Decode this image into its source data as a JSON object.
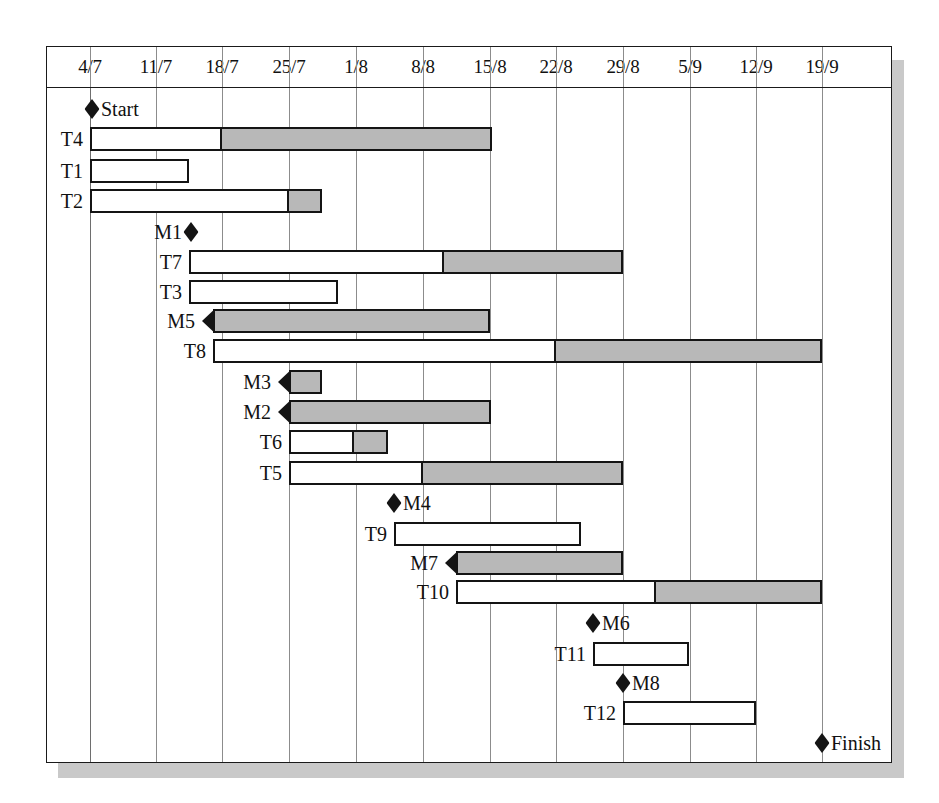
{
  "chart_data": {
    "type": "gantt",
    "title": "",
    "xlabel": "",
    "ylabel": "",
    "grid": true,
    "axis": {
      "tick_labels": [
        "4/7",
        "11/7",
        "18/7",
        "25/7",
        "1/8",
        "8/8",
        "15/8",
        "22/8",
        "29/8",
        "5/9",
        "12/9",
        "19/9"
      ],
      "tick_x": [
        89,
        155,
        221,
        288,
        355,
        422,
        489,
        555,
        622,
        689,
        755,
        821
      ],
      "week_px": 66.5,
      "x_start_px": 89,
      "x_end_px": 890
    },
    "rows": [
      {
        "name": "Start",
        "kind": "milestone",
        "label": "Start",
        "label_side": "right",
        "x": 91,
        "y": 108
      },
      {
        "name": "T4",
        "kind": "task",
        "label": "T4",
        "label_side": "left",
        "y": 138,
        "start": 89,
        "split": 221,
        "end": 491
      },
      {
        "name": "T1",
        "kind": "task",
        "label": "T1",
        "label_side": "left",
        "y": 170,
        "start": 89,
        "split": 188,
        "end": 188
      },
      {
        "name": "T2",
        "kind": "task",
        "label": "T2",
        "label_side": "left",
        "y": 200,
        "start": 89,
        "split": 288,
        "end": 321
      },
      {
        "name": "M1",
        "kind": "milestone",
        "label": "M1",
        "label_side": "left",
        "x": 190,
        "y": 231
      },
      {
        "name": "T7",
        "kind": "task",
        "label": "T7",
        "label_side": "left",
        "y": 261,
        "start": 188,
        "split": 443,
        "end": 622
      },
      {
        "name": "T3",
        "kind": "task",
        "label": "T3",
        "label_side": "left",
        "y": 291,
        "start": 188,
        "split": 337,
        "end": 337
      },
      {
        "name": "M5",
        "kind": "summary",
        "label": "M5",
        "label_side": "left",
        "y": 320,
        "start": 212,
        "end": 489
      },
      {
        "name": "T8",
        "kind": "task",
        "label": "T8",
        "label_side": "left",
        "y": 350,
        "start": 212,
        "split": 555,
        "end": 821
      },
      {
        "name": "M3",
        "kind": "summary",
        "label": "M3",
        "label_side": "left",
        "y": 381,
        "start": 288,
        "end": 321
      },
      {
        "name": "M2",
        "kind": "summary",
        "label": "M2",
        "label_side": "left",
        "y": 411,
        "start": 288,
        "end": 490
      },
      {
        "name": "T6",
        "kind": "task",
        "label": "T6",
        "label_side": "left",
        "y": 441,
        "start": 288,
        "split": 353,
        "end": 387
      },
      {
        "name": "T5",
        "kind": "task",
        "label": "T5",
        "label_side": "left",
        "y": 472,
        "start": 288,
        "split": 422,
        "end": 622
      },
      {
        "name": "M4",
        "kind": "milestone",
        "label": "M4",
        "label_side": "right",
        "x": 393,
        "y": 502
      },
      {
        "name": "T9",
        "kind": "task",
        "label": "T9",
        "label_side": "left",
        "y": 533,
        "start": 393,
        "split": 580,
        "end": 580
      },
      {
        "name": "M7",
        "kind": "summary",
        "label": "M7",
        "label_side": "left",
        "y": 562,
        "start": 455,
        "end": 622
      },
      {
        "name": "T10",
        "kind": "task",
        "label": "T10",
        "label_side": "left",
        "y": 591,
        "start": 455,
        "split": 655,
        "end": 821
      },
      {
        "name": "M6",
        "kind": "milestone",
        "label": "M6",
        "label_side": "right",
        "x": 592,
        "y": 622
      },
      {
        "name": "T11",
        "kind": "task",
        "label": "T11",
        "label_side": "left",
        "y": 653,
        "start": 592,
        "split": 688,
        "end": 688
      },
      {
        "name": "M8",
        "kind": "milestone",
        "label": "M8",
        "label_side": "right",
        "x": 622,
        "y": 682
      },
      {
        "name": "T12",
        "kind": "task",
        "label": "T12",
        "label_side": "left",
        "y": 712,
        "start": 622,
        "split": 755,
        "end": 755
      },
      {
        "name": "Finish",
        "kind": "milestone",
        "label": "Finish",
        "label_side": "right",
        "x": 821,
        "y": 742
      }
    ],
    "colors": {
      "bar_outline": "#141414",
      "bar_remaining": "#b8b8b8",
      "bar_complete": "#ffffff",
      "gridline": "#8c8c8c",
      "frame": "#1a1a1a",
      "shadow": "#c9c9c9",
      "background": "#ffffff"
    }
  }
}
